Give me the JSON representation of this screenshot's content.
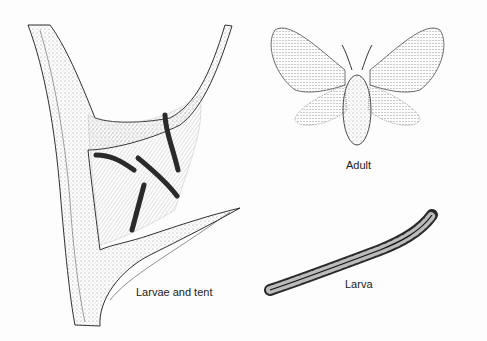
{
  "figures": [
    {
      "id": "larvae-tent",
      "label": "Larvae and tent"
    },
    {
      "id": "adult",
      "label": "Adult"
    },
    {
      "id": "larva",
      "label": "Larva"
    }
  ],
  "colors": {
    "ink": "#1a1a1a",
    "paper": "#fdfdfd",
    "larva": "#2a2a2a"
  }
}
